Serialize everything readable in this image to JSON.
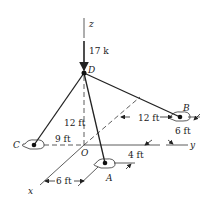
{
  "diagram": {
    "type": "3d-statics-tripod",
    "axes": {
      "x": "x",
      "y": "y",
      "z": "z",
      "origin": "O"
    },
    "points": {
      "D": "D",
      "A": "A",
      "B": "B",
      "C": "C"
    },
    "load": {
      "label": "17 k",
      "direction": "down (−z) at D"
    },
    "dimensions": {
      "height_OD": "12 ft",
      "OC": "9 ft",
      "B_along_y": "12 ft",
      "B_offset_x": "6 ft",
      "A_offset_y": "4 ft",
      "A_along_x": "6 ft"
    },
    "colors": {
      "line": "#222222",
      "background": "#ffffff"
    }
  }
}
